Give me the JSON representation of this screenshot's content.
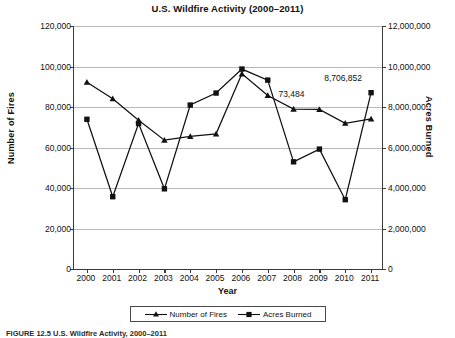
{
  "chart_data": {
    "type": "line",
    "title": "U.S. Wildfire Activity (2000–2011)",
    "xlabel": "Year",
    "ylabel": "Number of Fires",
    "y2label": "Acres Burned",
    "categories": [
      "2000",
      "2001",
      "2002",
      "2003",
      "2004",
      "2005",
      "2006",
      "2007",
      "2008",
      "2009",
      "2010",
      "2011"
    ],
    "ylim": [
      0,
      120000
    ],
    "y2lim": [
      0,
      12000000
    ],
    "yticks": [
      "0",
      "20,000",
      "40,000",
      "60,000",
      "80,000",
      "100,000",
      "120,000"
    ],
    "ytick_values": [
      0,
      20000,
      40000,
      60000,
      80000,
      100000,
      120000
    ],
    "y2ticks": [
      "0",
      "2,000,000",
      "4,000,000",
      "6,000,000",
      "8,000,000",
      "10,000,000",
      "12,000,000"
    ],
    "y2tick_values": [
      0,
      2000000,
      4000000,
      6000000,
      8000000,
      10000000,
      12000000
    ],
    "grid": true,
    "legend_position": "bottom",
    "series": [
      {
        "name": "Number of Fires",
        "axis": "left",
        "marker": "triangle",
        "values": [
          92250,
          84080,
          73460,
          63630,
          65460,
          66750,
          96390,
          85710,
          78980,
          78790,
          71970,
          74130
        ]
      },
      {
        "name": "Acres Burned",
        "axis": "right",
        "marker": "square",
        "values": [
          7393000,
          3570000,
          7184000,
          3960000,
          8097000,
          8689000,
          9873000,
          9328000,
          5292000,
          5921000,
          3423000,
          8706852
        ]
      }
    ],
    "annotations": [
      {
        "label": "8,706,852",
        "year": "2011",
        "series": "Acres Burned"
      },
      {
        "label": "73,484",
        "year": "2009",
        "series": "Number of Fires"
      }
    ]
  },
  "legend": {
    "items": [
      {
        "label": "Number of Fires",
        "marker": "triangle"
      },
      {
        "label": "Acres Burned",
        "marker": "square"
      }
    ]
  },
  "caption": "FIGURE 12.5   U.S. Wildfire Activity, 2000–2011"
}
